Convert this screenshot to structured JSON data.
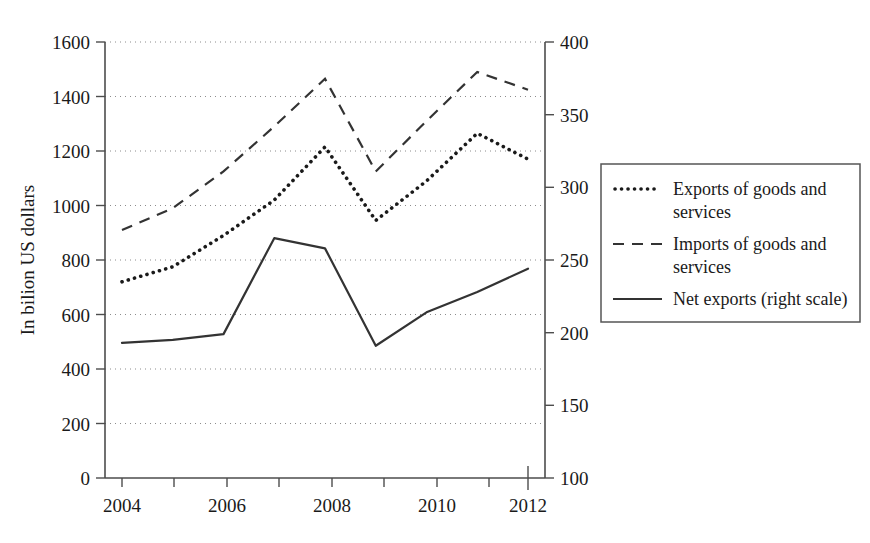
{
  "chart_data": {
    "type": "line",
    "title": "",
    "xlabel": "",
    "ylabel": "In bilion US dollars",
    "ylabel_right": "",
    "x": [
      2004,
      2005,
      2006,
      2007,
      2008,
      2009,
      2010,
      2011,
      2012
    ],
    "xlim": [
      2003.6,
      2012.4
    ],
    "ylim": [
      0,
      1600
    ],
    "ylim_right": [
      100,
      400
    ],
    "grid": true,
    "grid_axis": "y",
    "legend_position": "right-outside",
    "x_tick_labels": [
      "2004",
      "2006",
      "2008",
      "2010",
      "2012"
    ],
    "x_tick_values": [
      2004,
      2006,
      2008,
      2010,
      2012
    ],
    "x_minor_tick_values": [
      2005,
      2007,
      2009,
      2011
    ],
    "y_tick_labels": [
      "0",
      "200",
      "400",
      "600",
      "800",
      "1000",
      "1200",
      "1400",
      "1600"
    ],
    "y_tick_values": [
      0,
      200,
      400,
      600,
      800,
      1000,
      1200,
      1400,
      1600
    ],
    "y_right_tick_labels": [
      "100",
      "150",
      "200",
      "250",
      "300",
      "350",
      "400"
    ],
    "y_right_tick_values": [
      100,
      150,
      200,
      250,
      300,
      350,
      400
    ],
    "series": [
      {
        "name": "Exports of goods and services",
        "axis": "left",
        "style": "dotted",
        "values": [
          720,
          775,
          890,
          1020,
          1215,
          945,
          1090,
          1265,
          1170
        ]
      },
      {
        "name": "Imports of goods and services",
        "axis": "left",
        "style": "dashed",
        "values": [
          910,
          990,
          1125,
          1290,
          1465,
          1125,
          1310,
          1490,
          1425
        ]
      },
      {
        "name": "Net exports (right scale)",
        "axis": "right",
        "style": "solid",
        "values": [
          193,
          195,
          199,
          265,
          258,
          191,
          214,
          228,
          244
        ]
      }
    ]
  },
  "legend": {
    "items": [
      {
        "label": "Exports of goods and services",
        "style": "dotted"
      },
      {
        "label": "Imports of goods and services",
        "style": "dashed"
      },
      {
        "label": "Net exports (right scale)",
        "style": "solid"
      }
    ],
    "line1_exports": "Exports of goods and",
    "line2_exports": "services",
    "line1_imports": "Imports of goods and",
    "line2_imports": "services",
    "line1_net": "Net exports (right scale)"
  },
  "axes": {
    "y_label": "In bilion US dollars",
    "y_ticks": [
      "1600",
      "1400",
      "1200",
      "1000",
      "800",
      "600",
      "400",
      "200",
      "0"
    ],
    "y_right_ticks": [
      "400",
      "350",
      "300",
      "250",
      "200",
      "150",
      "100"
    ],
    "x_ticks": [
      "2004",
      "2006",
      "2008",
      "2010",
      "2012"
    ]
  },
  "colors": {
    "background": "#ffffff",
    "ink": "#1a1a1a",
    "axis": "#4d4d4d",
    "grid": "#8c8c8c",
    "series": "#333333"
  }
}
